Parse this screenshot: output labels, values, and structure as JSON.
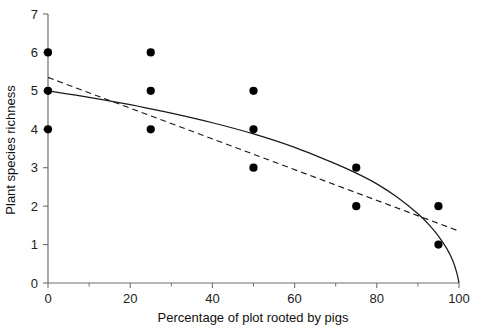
{
  "chart_data": {
    "type": "scatter",
    "title": "",
    "subtitle": "",
    "xlabel": "Percentage of plot rooted by pigs",
    "ylabel": "Plant species richness",
    "xlim": [
      0,
      100
    ],
    "ylim": [
      0,
      7
    ],
    "xticks": [
      0,
      20,
      40,
      60,
      80,
      100
    ],
    "xtick_labels": [
      "0",
      "20",
      "40",
      "60",
      "80",
      "100"
    ],
    "xminor_ticks": [
      10,
      30,
      50,
      70,
      90
    ],
    "yticks": [
      0,
      1,
      2,
      3,
      4,
      5,
      6,
      7
    ],
    "ytick_labels": [
      "0",
      "1",
      "2",
      "3",
      "4",
      "5",
      "6",
      "7"
    ],
    "grid": false,
    "legend": null,
    "points": [
      {
        "x": 0,
        "y": 6
      },
      {
        "x": 0,
        "y": 5
      },
      {
        "x": 0,
        "y": 4
      },
      {
        "x": 25,
        "y": 6
      },
      {
        "x": 25,
        "y": 5
      },
      {
        "x": 25,
        "y": 4
      },
      {
        "x": 50,
        "y": 5
      },
      {
        "x": 50,
        "y": 4
      },
      {
        "x": 50,
        "y": 3
      },
      {
        "x": 75,
        "y": 3
      },
      {
        "x": 75,
        "y": 2
      },
      {
        "x": 95,
        "y": 2
      },
      {
        "x": 95,
        "y": 1
      }
    ],
    "series": [
      {
        "name": "fitted-curve",
        "style": "solid",
        "points": [
          {
            "x": 0,
            "y": 5.0
          },
          {
            "x": 10,
            "y": 4.83
          },
          {
            "x": 20,
            "y": 4.64
          },
          {
            "x": 25,
            "y": 4.53
          },
          {
            "x": 30,
            "y": 4.42
          },
          {
            "x": 40,
            "y": 4.17
          },
          {
            "x": 50,
            "y": 3.88
          },
          {
            "x": 60,
            "y": 3.53
          },
          {
            "x": 70,
            "y": 3.1
          },
          {
            "x": 75,
            "y": 2.86
          },
          {
            "x": 80,
            "y": 2.58
          },
          {
            "x": 85,
            "y": 2.23
          },
          {
            "x": 90,
            "y": 1.8
          },
          {
            "x": 93,
            "y": 1.48
          },
          {
            "x": 95,
            "y": 1.22
          },
          {
            "x": 97,
            "y": 0.9
          },
          {
            "x": 98.5,
            "y": 0.58
          },
          {
            "x": 99.5,
            "y": 0.25
          },
          {
            "x": 100,
            "y": 0.0
          }
        ]
      },
      {
        "name": "linear-regression",
        "style": "dashed",
        "points": [
          {
            "x": 0,
            "y": 5.35
          },
          {
            "x": 100,
            "y": 1.35
          }
        ]
      }
    ]
  },
  "axis": {
    "x_title": "Percentage of plot rooted by pigs",
    "y_title": "Plant species richness"
  }
}
